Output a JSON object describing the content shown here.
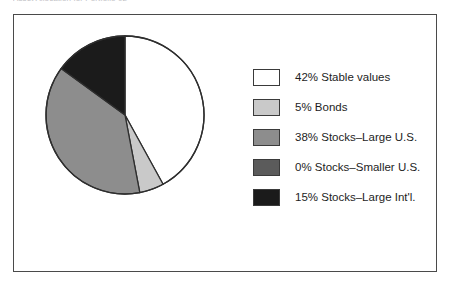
{
  "chart_title": "Asset Allocation for Portfolio 02",
  "frame": {
    "border_color": "#4a4a4a",
    "background": "#ffffff"
  },
  "chart_data": {
    "type": "pie",
    "title": "Asset Allocation for Portfolio 02",
    "xlabel": "",
    "ylabel": "",
    "legend_position": "right",
    "grid": false,
    "start_angle_deg": 0,
    "direction": "clockwise",
    "categories": [
      "Stable values",
      "Bonds",
      "Stocks–Large U.S.",
      "Stocks–Smaller U.S.",
      "Stocks–Large Int'l."
    ],
    "values": [
      42,
      5,
      38,
      0,
      15
    ],
    "colors": [
      "#ffffff",
      "#c9c9c9",
      "#8d8d8d",
      "#5b5b5b",
      "#1b1b1b"
    ],
    "slice_edge_color": "#2e2e2e",
    "slices": [
      {
        "label": "42% Stable values",
        "name": "Stable values",
        "value": 42,
        "percent_text": "42%",
        "color": "#ffffff",
        "start_deg": 0,
        "end_deg": 151.2
      },
      {
        "label": "5% Bonds",
        "name": "Bonds",
        "value": 5,
        "percent_text": "5%",
        "color": "#c9c9c9",
        "start_deg": 151.2,
        "end_deg": 169.2
      },
      {
        "label": "38% Stocks–Large U.S.",
        "name": "Stocks–Large U.S.",
        "value": 38,
        "percent_text": "38%",
        "color": "#8d8d8d",
        "start_deg": 169.2,
        "end_deg": 306.0
      },
      {
        "label": "0% Stocks–Smaller U.S.",
        "name": "Stocks–Smaller U.S.",
        "value": 0,
        "percent_text": "0%",
        "color": "#5b5b5b",
        "start_deg": 306.0,
        "end_deg": 306.0
      },
      {
        "label": "15% Stocks–Large Int'l.",
        "name": "Stocks–Large Int'l.",
        "value": 15,
        "percent_text": "15%",
        "color": "#1b1b1b",
        "start_deg": 306.0,
        "end_deg": 360.0
      }
    ]
  },
  "legend": {
    "items": [
      {
        "label": "42% Stable values",
        "color": "#ffffff"
      },
      {
        "label": "5% Bonds",
        "color": "#c9c9c9"
      },
      {
        "label": "38% Stocks–Large U.S.",
        "color": "#8d8d8d"
      },
      {
        "label": "0% Stocks–Smaller U.S.",
        "color": "#5b5b5b"
      },
      {
        "label": "15% Stocks–Large Int'l.",
        "color": "#1b1b1b"
      }
    ]
  }
}
